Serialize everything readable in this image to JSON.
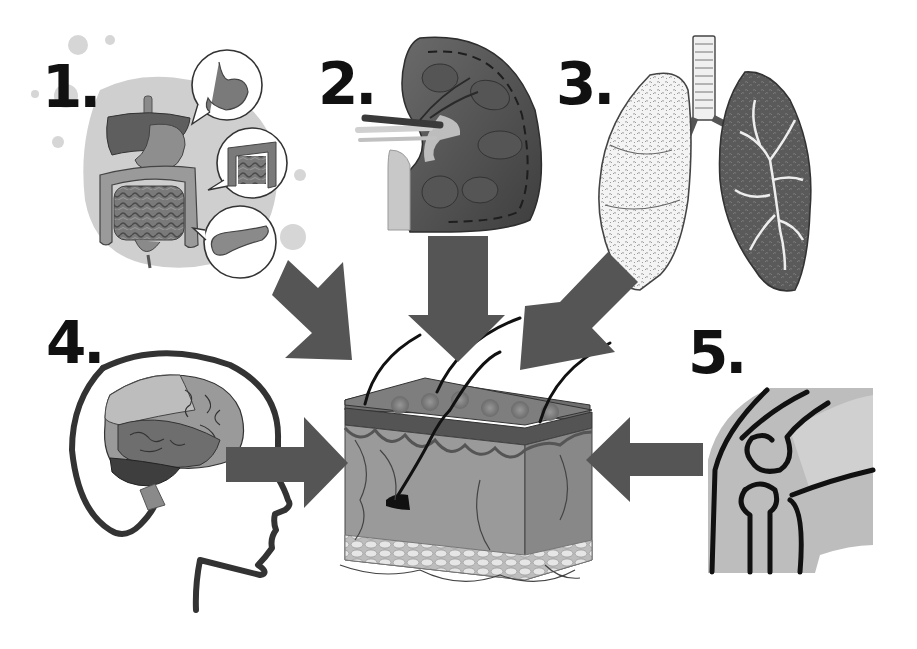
{
  "diagram": {
    "type": "organs-to-skin",
    "center": {
      "name": "skin-cross-section"
    },
    "labels": [
      {
        "id": "1",
        "text": "1.",
        "organ": "digestive system"
      },
      {
        "id": "2",
        "text": "2.",
        "organ": "kidney"
      },
      {
        "id": "3",
        "text": "3.",
        "organ": "lungs"
      },
      {
        "id": "4",
        "text": "4.",
        "organ": "brain"
      },
      {
        "id": "5",
        "text": "5.",
        "organ": "knee joint"
      }
    ],
    "arrows": [
      {
        "from": "digestive system",
        "to": "skin",
        "direction": "down-right"
      },
      {
        "from": "kidney",
        "to": "skin",
        "direction": "down"
      },
      {
        "from": "lungs",
        "to": "skin",
        "direction": "down-left"
      },
      {
        "from": "brain",
        "to": "skin",
        "direction": "right"
      },
      {
        "from": "knee joint",
        "to": "skin",
        "direction": "left"
      }
    ],
    "colors": {
      "arrow": "#555555",
      "label": "#111111",
      "blob": "#cfcfcf",
      "outline": "#222222"
    }
  }
}
